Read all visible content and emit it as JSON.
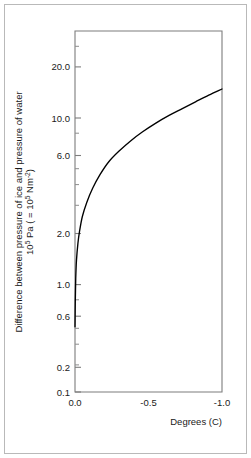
{
  "chart_data": {
    "type": "line",
    "title": "",
    "xlabel": "Degrees (C)",
    "ylabel_line1": "Difference between pressure of ice and pressure of water",
    "ylabel_line2_pre": "10",
    "ylabel_line2_exp1": "5",
    "ylabel_line2_mid": " Pa ( = 10",
    "ylabel_line2_exp2": "5",
    "ylabel_line2_mid2": " Nm",
    "ylabel_line2_exp3": "-2",
    "ylabel_line2_post": ")",
    "yscale": "log",
    "xscale": "linear",
    "xlim": [
      0.0,
      -1.0
    ],
    "ylim": [
      0.1,
      30.0
    ],
    "grid": false,
    "legend": "none",
    "xticks": [
      0.0,
      -0.5,
      -1.0
    ],
    "xtick_labels": [
      "0.0",
      "-0.5",
      "-1.0"
    ],
    "yticks": [
      0.1,
      0.2,
      0.6,
      1.0,
      2.0,
      6.0,
      10.0,
      20.0
    ],
    "ytick_labels": [
      "0.1",
      "0.2",
      "0.6",
      "1.0",
      "2.0",
      "6.0",
      "10.0",
      "20.0"
    ],
    "yminor_ticks": [
      0.3,
      0.4,
      0.5,
      0.8,
      3.0,
      4.0,
      5.0,
      8.0,
      30.0
    ],
    "x": [
      0.0,
      -0.002,
      -0.005,
      -0.01,
      -0.02,
      -0.03,
      -0.05,
      -0.08,
      -0.12,
      -0.17,
      -0.23,
      -0.3,
      -0.38,
      -0.46,
      -0.55,
      -0.64,
      -0.73,
      -0.82,
      -0.91,
      -1.0
    ],
    "values": [
      0.28,
      0.42,
      0.6,
      0.8,
      1.05,
      1.25,
      1.6,
      2.0,
      2.5,
      3.1,
      3.8,
      4.5,
      5.3,
      6.1,
      7.0,
      7.9,
      8.8,
      9.8,
      10.9,
      12.0
    ],
    "series": [
      {
        "name": "pressure difference",
        "values": [
          0.28,
          0.42,
          0.6,
          0.8,
          1.05,
          1.25,
          1.6,
          2.0,
          2.5,
          3.1,
          3.8,
          4.5,
          5.3,
          6.1,
          7.0,
          7.9,
          8.8,
          9.8,
          10.9,
          12.0
        ]
      }
    ],
    "colors": {
      "curve": "#000000",
      "axis": "#7d7d7d",
      "border": "#b9b9b9",
      "text": "#1a1a1a",
      "background": "#ffffff"
    }
  }
}
